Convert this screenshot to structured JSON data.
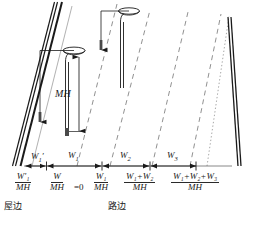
{
  "figure": {
    "type": "technical-diagram",
    "ink_color": "#1a1a1a",
    "dashed_color": "#6b6b6b",
    "dotted_color": "#8a8a8a"
  },
  "dimension_labels": {
    "mounting_height": "MH"
  },
  "segment_labels": [
    {
      "id": "w1prime",
      "text": "W",
      "sub": "1",
      "prime": "′"
    },
    {
      "id": "w1",
      "text": "W",
      "sub": "1",
      "prime": ""
    },
    {
      "id": "w2",
      "text": "W",
      "sub": "2",
      "prime": ""
    },
    {
      "id": "w3",
      "text": "W",
      "sub": "3",
      "prime": ""
    }
  ],
  "axis_fractions": [
    {
      "id": "f-w1prime-mh",
      "numerator": "W′₁",
      "denominator": "MH",
      "suffix": ""
    },
    {
      "id": "f-w-mh",
      "numerator": "W",
      "denominator": "MH",
      "suffix": "=0"
    },
    {
      "id": "f-w1-mh",
      "numerator": "W₁",
      "denominator": "MH",
      "suffix": ""
    },
    {
      "id": "f-w1w2-mh",
      "numerator": "W₁+W₂",
      "denominator": "MH",
      "suffix": ""
    },
    {
      "id": "f-w1w2w3-mh",
      "numerator": "W₁+W₂+W₃",
      "denominator": "MH",
      "suffix": ""
    }
  ],
  "annotations": {
    "house_side": "屋边",
    "road_side": "路边"
  }
}
